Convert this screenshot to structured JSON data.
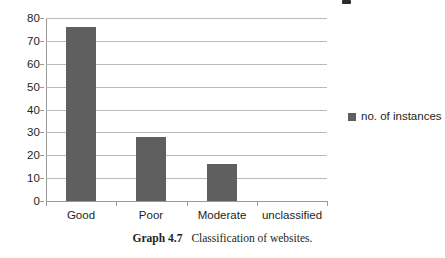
{
  "chart_data": {
    "type": "bar",
    "title": "",
    "subtitle": "",
    "xlabel": "",
    "ylabel": "",
    "categories": [
      "Good",
      "Poor",
      "Moderate",
      "unclassified"
    ],
    "series": [
      {
        "name": "no. of instances",
        "values": [
          76,
          28,
          16,
          0
        ],
        "color": "#5f5f5f"
      }
    ],
    "ylim": [
      0,
      80
    ],
    "yticks": [
      0,
      10,
      20,
      30,
      40,
      50,
      60,
      70,
      80
    ],
    "ytick_labels": [
      "0",
      "10",
      "20",
      "30",
      "40",
      "50",
      "60",
      "70",
      "80"
    ],
    "grid": true,
    "grid_axis": "y",
    "legend": {
      "position": "right",
      "entries": [
        {
          "label": "no. of instances",
          "color": "#5f5f5f",
          "marker": "square-swatch"
        }
      ]
    }
  },
  "caption": {
    "label": "Graph 4.7",
    "text": "Classification of websites."
  },
  "colors": {
    "bar": "#5f5f5f",
    "gridline": "#b9b9b9",
    "axis": "#9a9a9a",
    "text": "#231f20",
    "background": "#ffffff"
  }
}
